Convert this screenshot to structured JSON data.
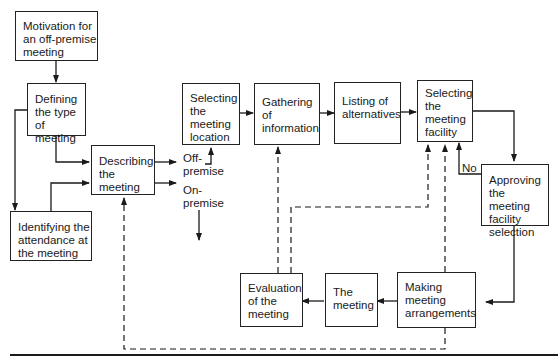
{
  "diagram": {
    "type": "flowchart",
    "nodes": [
      {
        "id": "motivation",
        "label": "Motivation for an off-premise meeting"
      },
      {
        "id": "defining",
        "label": "Defining the type of meeting"
      },
      {
        "id": "identifying",
        "label": "Identifying the attendance at the meeting"
      },
      {
        "id": "describing",
        "label": "Describing the meeting"
      },
      {
        "id": "selecting_location",
        "label": "Selecting the meeting location"
      },
      {
        "id": "gathering",
        "label": "Gathering of information"
      },
      {
        "id": "listing",
        "label": "Listing of alternatives"
      },
      {
        "id": "selecting_facility",
        "label": "Selecting the meeting facility"
      },
      {
        "id": "approving",
        "label": "Approving the meeting facility selection"
      },
      {
        "id": "making",
        "label": "Making meeting arrangements"
      },
      {
        "id": "meeting",
        "label": "The meeting"
      },
      {
        "id": "evaluation",
        "label": "Evaluation of the meeting"
      }
    ],
    "labels": {
      "off_premise": "Off-premise",
      "on_premise": "On-premise",
      "no": "No"
    },
    "edges": [
      {
        "from": "motivation",
        "to": "defining",
        "style": "solid"
      },
      {
        "from": "defining",
        "to": "describing",
        "style": "solid"
      },
      {
        "from": "defining",
        "to": "identifying",
        "style": "solid"
      },
      {
        "from": "identifying",
        "to": "describing",
        "style": "solid"
      },
      {
        "from": "describing",
        "to": "selecting_location",
        "label": "Off-premise",
        "style": "solid"
      },
      {
        "from": "describing",
        "to": "on_premise_exit",
        "label": "On-premise",
        "style": "solid"
      },
      {
        "from": "selecting_location",
        "to": "gathering",
        "style": "solid"
      },
      {
        "from": "gathering",
        "to": "listing",
        "style": "solid"
      },
      {
        "from": "listing",
        "to": "selecting_facility",
        "style": "solid"
      },
      {
        "from": "selecting_facility",
        "to": "approving",
        "style": "solid"
      },
      {
        "from": "approving",
        "to": "selecting_facility",
        "label": "No",
        "style": "solid"
      },
      {
        "from": "approving",
        "to": "making",
        "style": "solid"
      },
      {
        "from": "making",
        "to": "meeting",
        "style": "solid"
      },
      {
        "from": "meeting",
        "to": "evaluation",
        "style": "solid"
      },
      {
        "from": "evaluation",
        "to": "gathering",
        "style": "dashed"
      },
      {
        "from": "evaluation",
        "to": "selecting_facility",
        "style": "dashed"
      },
      {
        "from": "making",
        "to": "selecting_facility",
        "style": "dashed"
      },
      {
        "from": "making",
        "to": "describing",
        "style": "dashed"
      }
    ]
  }
}
